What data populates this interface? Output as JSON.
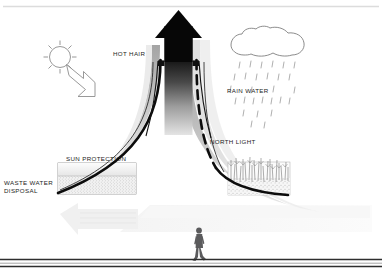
{
  "diagram": {
    "type": "architectural-bioclimatic-section",
    "labels": {
      "hot_hair": "HOT HAIR",
      "rain_water": "RAIN WATER",
      "north_light": "NORTH LIGHT",
      "sun_protection": "SUN PROTECTION",
      "waste_water_disposal": "WASTE WATER\nDISPOSAL"
    },
    "icons": {
      "sun": "sun-icon",
      "sun_ray_arrow": "arrow-down-right-icon",
      "cloud": "cloud-icon",
      "rain": "rain-drops-icon",
      "chimney_arrow": "arrow-up-icon",
      "vegetation": "vegetation-icon",
      "person": "person-walking-icon",
      "waste_arrow": "arrow-left-icon"
    },
    "colors": {
      "ink": "#111111",
      "label_text": "#1d1d1d",
      "hot_air_dark": "#0a0a0a",
      "plume_gray": "#b9b9b9",
      "faint_gray": "#ededed",
      "line_gray": "#d8d8d8",
      "person_gray": "#59595b",
      "ground_line": "#2b2b2b"
    }
  }
}
